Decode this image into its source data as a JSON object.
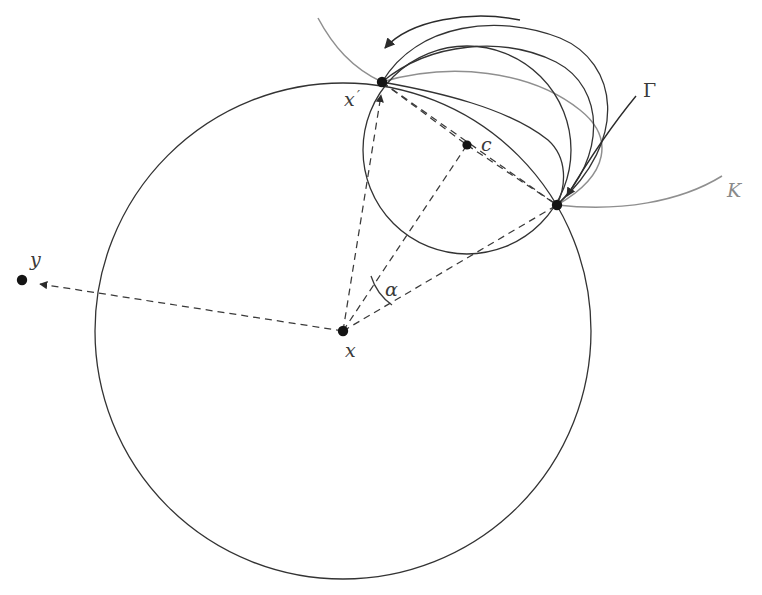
{
  "figure": {
    "kind": "geometry-diagram",
    "background_color": "#ffffff",
    "width": 762,
    "height": 595,
    "stroke_dark": "#333333",
    "stroke_gray": "#8f8f8f",
    "dash_color": "#3a3a3a"
  },
  "labels": {
    "y": "y",
    "x": "x",
    "x_prime_base": "x",
    "x_prime_mark": "′",
    "c": "c",
    "alpha": "α",
    "gamma": "Γ",
    "K": "K"
  },
  "points": [
    {
      "id": "y",
      "label": "y",
      "x": 22,
      "y": 280,
      "label_x": 30,
      "label_y": 266
    },
    {
      "id": "x",
      "label": "x",
      "x": 343,
      "y": 331,
      "label_x": 345,
      "label_y": 357
    },
    {
      "id": "x_prime",
      "label": "x′",
      "x": 382,
      "y": 82,
      "label_x": 346,
      "label_y": 106
    },
    {
      "id": "c",
      "label": "c",
      "x": 467,
      "y": 145,
      "label_x": 481,
      "label_y": 150
    },
    {
      "id": "k_point",
      "label": "",
      "x": 557,
      "y": 205,
      "label_x": 0,
      "label_y": 0
    }
  ],
  "circles": [
    {
      "id": "big-circle",
      "cx": 343,
      "cy": 331,
      "r": 248,
      "color": "#333333",
      "label": ""
    },
    {
      "id": "small-circle",
      "cx": 467,
      "cy": 150,
      "r": 104,
      "color": "#333333",
      "label": ""
    }
  ],
  "annotations": {
    "gamma": {
      "label": "Γ",
      "label_x": 642,
      "label_y": 95,
      "describes": "family of curves from x-prime to k-point"
    },
    "K": {
      "label": "K",
      "label_x": 726,
      "label_y": 196,
      "describes": "gray curve through k-point"
    },
    "alpha": {
      "label": "α",
      "label_x": 385,
      "label_y": 295,
      "describes": "angle at x between ray to c and ray to k-point"
    }
  },
  "dashed_segments": [
    {
      "id": "x-to-y",
      "from": "x",
      "to": "y",
      "arrow": true
    },
    {
      "id": "x-to-xprime",
      "from": "x",
      "to": "x_prime",
      "arrow": true
    },
    {
      "id": "x-to-c",
      "from": "x",
      "to": "c",
      "arrow": false
    },
    {
      "id": "x-to-kpoint",
      "from": "x",
      "to": "k_point",
      "arrow": false
    },
    {
      "id": "xprime-to-c",
      "from": "x_prime",
      "to": "c",
      "arrow": false
    },
    {
      "id": "c-to-kpoint",
      "from": "c",
      "to": "k_point",
      "arrow": false
    },
    {
      "id": "xprime-to-kpoint",
      "from": "x_prime",
      "to": "k_point",
      "arrow": false
    }
  ]
}
